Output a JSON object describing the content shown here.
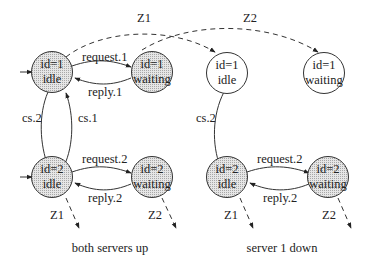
{
  "panels": [
    {
      "caption": "both servers up",
      "nodes": [
        {
          "id": "p1-idle1",
          "line1": "id=1",
          "line2": "idle",
          "shaded": true
        },
        {
          "id": "p1-wait1",
          "line1": "id=1",
          "line2": "waiting",
          "shaded": true
        },
        {
          "id": "p1-idle2",
          "line1": "id=2",
          "line2": "idle",
          "shaded": true
        },
        {
          "id": "p1-wait2",
          "line1": "id=2",
          "line2": "waiting",
          "shaded": true
        }
      ],
      "edges": {
        "request1": "request.1",
        "reply1": "reply.1",
        "cs2": "cs.2",
        "cs1": "cs.1",
        "request2": "request.2",
        "reply2": "reply.2",
        "z1_out": "Z1",
        "z2_out": "Z2"
      }
    },
    {
      "caption": "server 1 down",
      "nodes": [
        {
          "id": "p2-idle1",
          "line1": "id=1",
          "line2": "idle",
          "shaded": false
        },
        {
          "id": "p2-wait1",
          "line1": "id=1",
          "line2": "waiting",
          "shaded": false
        },
        {
          "id": "p2-idle2",
          "line1": "id=2",
          "line2": "idle",
          "shaded": true
        },
        {
          "id": "p2-wait2",
          "line1": "id=2",
          "line2": "waiting",
          "shaded": true
        }
      ],
      "edges": {
        "cs2": "cs.2",
        "request2": "request.2",
        "reply2": "reply.2",
        "z1_out": "Z1",
        "z2_out": "Z2"
      }
    }
  ],
  "cross_transitions": {
    "z1": "Z1",
    "z2": "Z2"
  },
  "colors": {
    "shaded_fill": "#d4d4d4",
    "unshaded_fill": "#ffffff",
    "stroke": "#333333"
  }
}
